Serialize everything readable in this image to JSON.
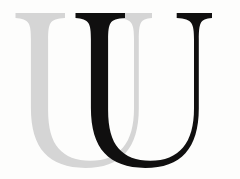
{
  "image": {
    "kind": "logo-mark",
    "subject": "two-overlapping-serif-capital-U-letterforms",
    "alt_text": "Logo consisting of a light grey serif capital U overlapped by a black serif capital U",
    "width": 240,
    "height": 179,
    "background_color": "#fdfdfc"
  },
  "marks": [
    {
      "id": "u-back",
      "letter": "U",
      "role": "background-letter",
      "color": "#d5d5d5",
      "layer": 1,
      "offset_x": 0
    },
    {
      "id": "u-front",
      "letter": "U",
      "role": "foreground-letter",
      "color": "#100f0f",
      "layer": 2,
      "offset_x": 60
    }
  ],
  "geometry": {
    "u_path": "M 15.5 18.0 L 15.5 13.0 L 65.0 13.0 L 65.0 18.0 C 57.0 18.6 52.6 19.9 50.5 23.2 C 48.6 26.2 48.1 31.2 48.1 39.5 L 48.1 110.0 C 48.1 128.0 51.6 140.5 58.6 148.6 C 65.6 156.7 76.2 160.8 90.3 160.8 C 104.6 160.8 115.6 156.3 123.0 147.5 C 130.4 138.6 134.0 125.5 134.0 108.4 L 134.0 39.5 C 134.0 31.2 133.4 26.2 131.4 23.2 C 129.2 19.9 124.8 18.6 116.7 18.0 L 116.7 13.0 L 152.0 13.0 L 152.0 18.0 C 145.8 18.6 142.4 19.9 140.7 23.2 C 139.2 26.2 138.8 31.2 138.8 39.5 L 138.8 108.4 C 138.8 128.4 134.3 143.3 125.4 153.2 C 116.5 163.0 103.0 167.9 85.2 167.9 C 67.0 167.9 53.4 163.0 44.4 153.1 C 35.4 143.3 30.9 128.3 30.9 108.0 L 30.9 39.5 C 30.9 31.2 30.4 26.2 28.5 23.2 C 26.4 19.9 22.0 18.6 15.5 18.0 Z",
    "description": "Serif capital U outline: flared slab serifs on both stem tops, heavy left stem, light right stem, rounded bowl."
  },
  "colors": {
    "grey_letter": "#d5d5d5",
    "black_letter": "#100f0f",
    "background": "#fdfdfc"
  }
}
